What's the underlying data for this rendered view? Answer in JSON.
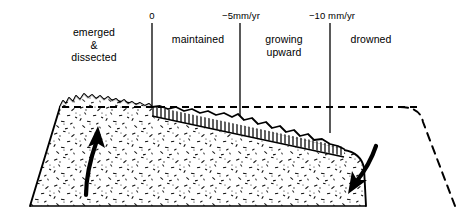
{
  "figure": {
    "background_color": "#ffffff",
    "ink_color": "#000000",
    "width": 465,
    "height": 221
  },
  "zones": [
    {
      "id": "emerged",
      "label": "emerged\n&\ndissected",
      "x_center": 94
    },
    {
      "id": "maintained",
      "label": "maintained",
      "x_center": 198
    },
    {
      "id": "growing",
      "label": "growing\nupward",
      "x_center": 284
    },
    {
      "id": "drowned",
      "label": "drowned",
      "x_center": 371
    }
  ],
  "rate_ticks": [
    {
      "id": "tick-0",
      "label": "0",
      "x": 152,
      "y_top": 23,
      "y_bottom": 107
    },
    {
      "id": "tick-5",
      "label": "−5mm/yr",
      "x": 240,
      "y_top": 23,
      "y_bottom": 116
    },
    {
      "id": "tick-10",
      "label": "−10 mm/yr",
      "x": 330,
      "y_top": 23,
      "y_bottom": 133
    }
  ],
  "sea_level": {
    "id": "sea-level-line",
    "style": "dashed",
    "y": 107,
    "x_start": 62,
    "x_end": 420
  },
  "arrows": [
    {
      "id": "uplift-arrow",
      "direction": "up",
      "label": "uplift"
    },
    {
      "id": "subsidence-arrow",
      "direction": "down",
      "label": "subsidence"
    }
  ],
  "former_profile": {
    "id": "former-island-outline",
    "style": "dashed",
    "description": "dashed former island profile on right"
  },
  "reef": {
    "id": "reef-growth-hatching",
    "description": "vertical hatched reef growth from 0 line sloping down to right"
  }
}
